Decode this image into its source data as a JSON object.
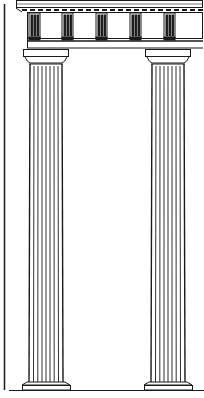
{
  "illustration": {
    "subject": "Two Doric columns supporting an entablature with triglyph frieze",
    "colors": {
      "ink": "#1a1a1a",
      "paper": "#ffffff"
    },
    "entablature": {
      "cornice": {
        "x": 16,
        "y": 0,
        "w": 184,
        "h": 8
      },
      "frieze": {
        "x": 27,
        "y": 12,
        "w": 173,
        "h": 26
      },
      "triglyph_xs": [
        29,
        62,
        96,
        130,
        164
      ],
      "architrave": {
        "x": 27,
        "y": 38,
        "w": 173,
        "h": 10
      }
    },
    "columns": [
      {
        "id": "left",
        "capital_x": 23,
        "shaft_x": 30,
        "shaft_w": 32,
        "base_x": 22
      },
      {
        "id": "right",
        "capital_x": 145,
        "shaft_x": 151,
        "shaft_w": 32,
        "base_x": 144
      }
    ],
    "column_top": 48,
    "shaft_top": 64,
    "shaft_bottom": 382,
    "ground_y": 390,
    "left_frame_line_x": 4
  }
}
